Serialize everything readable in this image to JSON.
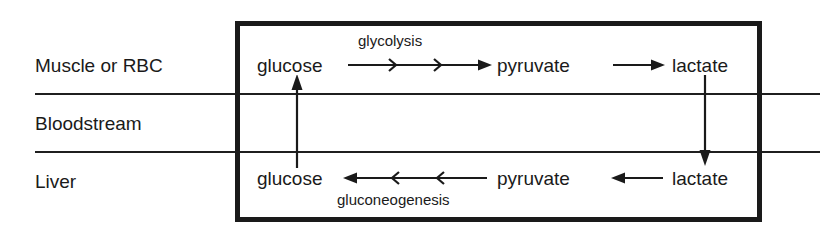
{
  "diagram": {
    "compartments": [
      {
        "id": "muscle",
        "label": "Muscle or RBC"
      },
      {
        "id": "bloodstream",
        "label": "Bloodstream"
      },
      {
        "id": "liver",
        "label": "Liver"
      }
    ],
    "nodes": {
      "glucose_muscle": "glucose",
      "pyruvate_muscle": "pyruvate",
      "lactate_muscle": "lactate",
      "glucose_liver": "glucose",
      "pyruvate_liver": "pyruvate",
      "lactate_liver": "lactate"
    },
    "pathways": {
      "glycolysis": "glycolysis",
      "gluconeogenesis": "gluconeogenesis"
    },
    "arrows": [
      {
        "name": "glucose-to-pyruvate-muscle",
        "from": "glucose_muscle",
        "to": "pyruvate_muscle",
        "direction": "right",
        "label": "glycolysis",
        "multistep": true
      },
      {
        "name": "pyruvate-to-lactate-muscle",
        "from": "pyruvate_muscle",
        "to": "lactate_muscle",
        "direction": "right",
        "label": "",
        "multistep": false
      },
      {
        "name": "lactate-muscle-to-liver",
        "from": "lactate_muscle",
        "to": "lactate_liver",
        "direction": "down",
        "label": "",
        "multistep": false
      },
      {
        "name": "lactate-to-pyruvate-liver",
        "from": "lactate_liver",
        "to": "pyruvate_liver",
        "direction": "left",
        "label": "",
        "multistep": false
      },
      {
        "name": "pyruvate-to-glucose-liver",
        "from": "pyruvate_liver",
        "to": "glucose_liver",
        "direction": "left",
        "label": "gluconeogenesis",
        "multistep": true
      },
      {
        "name": "glucose-liver-to-muscle",
        "from": "glucose_liver",
        "to": "glucose_muscle",
        "direction": "up",
        "label": "",
        "multistep": false
      }
    ],
    "colors": {
      "ink": "#1a1a1a",
      "background": "#ffffff",
      "rule": "#1f1f1f"
    }
  }
}
